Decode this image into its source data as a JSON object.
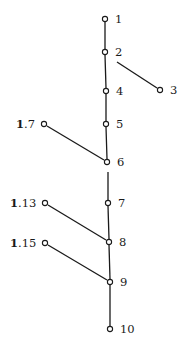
{
  "diagram": {
    "type": "hasse-diagram",
    "nodes": [
      {
        "id": "1",
        "label": "1",
        "x": 105,
        "y": 19,
        "label_side": "right"
      },
      {
        "id": "2",
        "label": "2",
        "x": 105,
        "y": 52,
        "label_side": "right"
      },
      {
        "id": "3",
        "label": "3",
        "x": 160,
        "y": 90,
        "label_side": "right"
      },
      {
        "id": "4",
        "label": "4",
        "x": 106,
        "y": 91,
        "label_side": "right"
      },
      {
        "id": "5",
        "label": "5",
        "x": 106,
        "y": 124,
        "label_side": "right"
      },
      {
        "id": "6",
        "label": "6",
        "x": 107,
        "y": 162,
        "label_side": "right"
      },
      {
        "id": "7",
        "label": "7",
        "x": 108,
        "y": 203,
        "label_side": "right"
      },
      {
        "id": "8",
        "label": "8",
        "x": 109,
        "y": 242,
        "label_side": "right"
      },
      {
        "id": "9",
        "label": "9",
        "x": 110,
        "y": 282,
        "label_side": "right"
      },
      {
        "id": "10",
        "label": "10",
        "x": 110,
        "y": 329,
        "label_side": "right"
      },
      {
        "id": "1.7",
        "label_bold": "1",
        "label_rest": ".7",
        "x": 44,
        "y": 124,
        "label_side": "left"
      },
      {
        "id": "1.13",
        "label_bold": "1",
        "label_rest": ".13",
        "x": 45,
        "y": 203,
        "label_side": "left"
      },
      {
        "id": "1.15",
        "label_bold": "1",
        "label_rest": ".15",
        "x": 45,
        "y": 243,
        "label_side": "left"
      }
    ],
    "edges": [
      {
        "from": "1",
        "to": "2"
      },
      {
        "from": "2",
        "to": "4"
      },
      {
        "from": "4",
        "to": "5"
      },
      {
        "from": "5",
        "to": "6"
      },
      {
        "from": "6",
        "to": "7",
        "note": "drawn with gap below 6"
      },
      {
        "from": "7",
        "to": "8"
      },
      {
        "from": "8",
        "to": "9"
      },
      {
        "from": "9",
        "to": "10"
      },
      {
        "from": "2",
        "to": "3",
        "note": "detached segment"
      },
      {
        "from": "1.7",
        "to": "6"
      },
      {
        "from": "1.13",
        "to": "8"
      },
      {
        "from": "1.15",
        "to": "9"
      }
    ]
  },
  "labels": {
    "n1": "1",
    "n2": "2",
    "n3": "3",
    "n4": "4",
    "n5": "5",
    "n6": "6",
    "n7": "7",
    "n8": "8",
    "n9": "9",
    "n10": "10",
    "n1_7_bold": "1",
    "n1_7_rest": ".7",
    "n1_13_bold": "1",
    "n1_13_rest": ".13",
    "n1_15_bold": "1",
    "n1_15_rest": ".15"
  }
}
